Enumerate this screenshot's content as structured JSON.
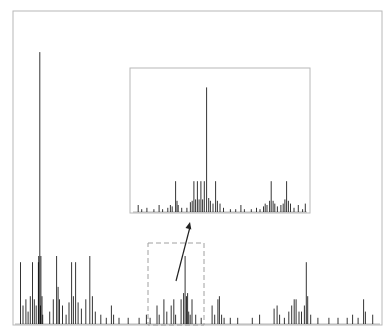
{
  "chart_data": {
    "type": "bar",
    "title": "",
    "xlabel": "",
    "ylabel": "",
    "grid": false,
    "main": {
      "frame": {
        "x0": 13,
        "y0": 11,
        "x1": 382,
        "y1": 325
      },
      "xlim": [
        0,
        100
      ],
      "ylim": [
        0,
        100
      ],
      "peaks": [
        {
          "x": 1.5,
          "y": 20
        },
        {
          "x": 2.2,
          "y": 6
        },
        {
          "x": 3.0,
          "y": 8
        },
        {
          "x": 3.6,
          "y": 4
        },
        {
          "x": 4.2,
          "y": 9
        },
        {
          "x": 4.8,
          "y": 20
        },
        {
          "x": 5.3,
          "y": 8
        },
        {
          "x": 5.8,
          "y": 6
        },
        {
          "x": 6.4,
          "y": 20
        },
        {
          "x": 7.0,
          "y": 6
        },
        {
          "x": 7.6,
          "y": 3
        },
        {
          "x": 6.8,
          "y": 88
        },
        {
          "x": 6.5,
          "y": 22
        },
        {
          "x": 7.1,
          "y": 22
        },
        {
          "x": 7.4,
          "y": 9
        },
        {
          "x": 9.5,
          "y": 4
        },
        {
          "x": 10.5,
          "y": 8
        },
        {
          "x": 11.4,
          "y": 22
        },
        {
          "x": 11.8,
          "y": 12
        },
        {
          "x": 12.2,
          "y": 8
        },
        {
          "x": 13.0,
          "y": 6
        },
        {
          "x": 14.0,
          "y": 3
        },
        {
          "x": 14.8,
          "y": 7
        },
        {
          "x": 15.5,
          "y": 20
        },
        {
          "x": 16.0,
          "y": 9
        },
        {
          "x": 16.6,
          "y": 20
        },
        {
          "x": 17.3,
          "y": 7
        },
        {
          "x": 18.2,
          "y": 5
        },
        {
          "x": 19.4,
          "y": 8
        },
        {
          "x": 20.5,
          "y": 22
        },
        {
          "x": 21.2,
          "y": 9
        },
        {
          "x": 22.0,
          "y": 4
        },
        {
          "x": 23.5,
          "y": 3
        },
        {
          "x": 25.0,
          "y": 2
        },
        {
          "x": 26.4,
          "y": 6
        },
        {
          "x": 27.0,
          "y": 3
        },
        {
          "x": 28.5,
          "y": 2
        },
        {
          "x": 31.0,
          "y": 2
        },
        {
          "x": 34.0,
          "y": 2
        },
        {
          "x": 36.0,
          "y": 3
        },
        {
          "x": 37.0,
          "y": 2
        },
        {
          "x": 38.9,
          "y": 6
        },
        {
          "x": 39.5,
          "y": 3
        },
        {
          "x": 40.8,
          "y": 8
        },
        {
          "x": 41.6,
          "y": 4
        },
        {
          "x": 42.8,
          "y": 6
        },
        {
          "x": 43.5,
          "y": 8
        },
        {
          "x": 44.0,
          "y": 3
        },
        {
          "x": 45.5,
          "y": 8
        },
        {
          "x": 46.2,
          "y": 10
        },
        {
          "x": 46.6,
          "y": 22
        },
        {
          "x": 47.0,
          "y": 9
        },
        {
          "x": 47.3,
          "y": 10
        },
        {
          "x": 47.6,
          "y": 4
        },
        {
          "x": 48.0,
          "y": 3
        },
        {
          "x": 48.5,
          "y": 8
        },
        {
          "x": 49.5,
          "y": 3
        },
        {
          "x": 51.0,
          "y": 2
        },
        {
          "x": 54.0,
          "y": 6
        },
        {
          "x": 54.7,
          "y": 3
        },
        {
          "x": 55.6,
          "y": 8
        },
        {
          "x": 56.0,
          "y": 9
        },
        {
          "x": 56.6,
          "y": 3
        },
        {
          "x": 57.3,
          "y": 2
        },
        {
          "x": 59.0,
          "y": 2
        },
        {
          "x": 61.0,
          "y": 2
        },
        {
          "x": 65.0,
          "y": 2
        },
        {
          "x": 67.0,
          "y": 3
        },
        {
          "x": 71.0,
          "y": 5
        },
        {
          "x": 71.8,
          "y": 6
        },
        {
          "x": 72.5,
          "y": 3
        },
        {
          "x": 73.8,
          "y": 2
        },
        {
          "x": 75.0,
          "y": 4
        },
        {
          "x": 75.8,
          "y": 6
        },
        {
          "x": 76.5,
          "y": 8
        },
        {
          "x": 77.0,
          "y": 8
        },
        {
          "x": 77.8,
          "y": 4
        },
        {
          "x": 78.5,
          "y": 4
        },
        {
          "x": 79.3,
          "y": 6
        },
        {
          "x": 79.8,
          "y": 20
        },
        {
          "x": 80.2,
          "y": 9
        },
        {
          "x": 81.0,
          "y": 3
        },
        {
          "x": 83.0,
          "y": 2
        },
        {
          "x": 86.0,
          "y": 2
        },
        {
          "x": 88.5,
          "y": 2
        },
        {
          "x": 91.0,
          "y": 2
        },
        {
          "x": 92.5,
          "y": 3
        },
        {
          "x": 94.0,
          "y": 2
        },
        {
          "x": 95.5,
          "y": 8
        },
        {
          "x": 96.0,
          "y": 4
        },
        {
          "x": 98.0,
          "y": 3
        }
      ]
    },
    "zoom_region": {
      "dashed_box": {
        "x0": 148,
        "y0": 243,
        "x1": 204,
        "y1": 325
      },
      "arrow": {
        "from": [
          176,
          281
        ],
        "to": [
          190,
          222
        ]
      }
    },
    "inset": {
      "frame": {
        "x0": 130,
        "y0": 68,
        "x1": 310,
        "y1": 213
      },
      "xlim": [
        0,
        100
      ],
      "ylim": [
        0,
        100
      ],
      "peaks": [
        {
          "x": 3,
          "y": 5
        },
        {
          "x": 5,
          "y": 2
        },
        {
          "x": 8,
          "y": 3
        },
        {
          "x": 12,
          "y": 2
        },
        {
          "x": 15,
          "y": 5
        },
        {
          "x": 17,
          "y": 2
        },
        {
          "x": 20,
          "y": 3
        },
        {
          "x": 21.5,
          "y": 5
        },
        {
          "x": 22.5,
          "y": 4
        },
        {
          "x": 24.5,
          "y": 22
        },
        {
          "x": 25.3,
          "y": 8
        },
        {
          "x": 26,
          "y": 5
        },
        {
          "x": 28,
          "y": 3
        },
        {
          "x": 31,
          "y": 3
        },
        {
          "x": 33,
          "y": 7
        },
        {
          "x": 34,
          "y": 8
        },
        {
          "x": 35,
          "y": 22
        },
        {
          "x": 36,
          "y": 9
        },
        {
          "x": 37,
          "y": 22
        },
        {
          "x": 38,
          "y": 9
        },
        {
          "x": 39,
          "y": 22
        },
        {
          "x": 40,
          "y": 9
        },
        {
          "x": 41,
          "y": 22
        },
        {
          "x": 42.3,
          "y": 89
        },
        {
          "x": 43.5,
          "y": 10
        },
        {
          "x": 44.5,
          "y": 8
        },
        {
          "x": 46,
          "y": 6
        },
        {
          "x": 47.5,
          "y": 22
        },
        {
          "x": 48.5,
          "y": 8
        },
        {
          "x": 50,
          "y": 6
        },
        {
          "x": 52,
          "y": 3
        },
        {
          "x": 56,
          "y": 2
        },
        {
          "x": 59,
          "y": 2
        },
        {
          "x": 62,
          "y": 5
        },
        {
          "x": 64,
          "y": 2
        },
        {
          "x": 68,
          "y": 2
        },
        {
          "x": 71,
          "y": 3
        },
        {
          "x": 73,
          "y": 2
        },
        {
          "x": 75,
          "y": 4
        },
        {
          "x": 76,
          "y": 6
        },
        {
          "x": 77,
          "y": 5
        },
        {
          "x": 78.5,
          "y": 8
        },
        {
          "x": 79.4,
          "y": 22
        },
        {
          "x": 80.5,
          "y": 8
        },
        {
          "x": 81.5,
          "y": 6
        },
        {
          "x": 83,
          "y": 4
        },
        {
          "x": 85,
          "y": 5
        },
        {
          "x": 86.3,
          "y": 6
        },
        {
          "x": 87.3,
          "y": 9
        },
        {
          "x": 88.3,
          "y": 22
        },
        {
          "x": 89.3,
          "y": 8
        },
        {
          "x": 90.5,
          "y": 6
        },
        {
          "x": 92.5,
          "y": 3
        },
        {
          "x": 95,
          "y": 5
        },
        {
          "x": 97.5,
          "y": 2
        },
        {
          "x": 99,
          "y": 6
        }
      ]
    }
  }
}
